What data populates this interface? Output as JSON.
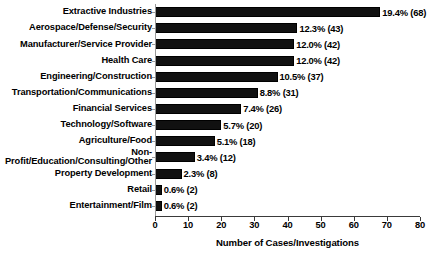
{
  "chart_data": {
    "type": "bar",
    "orientation": "horizontal",
    "title": "",
    "xlabel": "Number of Cases/Investigations",
    "ylabel": "",
    "xlim": [
      0,
      80
    ],
    "xticks": [
      0,
      10,
      20,
      30,
      40,
      50,
      60,
      70,
      80
    ],
    "grid": false,
    "legend": null,
    "categories": [
      "Extractive Industries",
      "Aerospace/Defense/Security",
      "Manufacturer/Service Provider",
      "Health Care",
      "Engineering/Construction",
      "Transportation/Communications",
      "Financial Services",
      "Technology/Software",
      "Agriculture/Food",
      "Non-\nProfit/Education/Consulting/Other",
      "Property Development",
      "Retail",
      "Entertainment/Film"
    ],
    "values": [
      68,
      43,
      42,
      42,
      37,
      31,
      26,
      20,
      18,
      12,
      8,
      2,
      2
    ],
    "percents": [
      "19.4%",
      "12.3%",
      "12.0%",
      "12.0%",
      "10.5%",
      "8.8%",
      "7.4%",
      "5.7%",
      "5.1%",
      "3.4%",
      "2.3%",
      "0.6%",
      "0.6%"
    ],
    "data_labels": [
      "19.4% (68)",
      "12.3% (43)",
      "12.0% (42)",
      "12.0% (42)",
      "10.5% (37)",
      "8.8% (31)",
      "7.4% (26)",
      "5.7% (20)",
      "5.1% (18)",
      "3.4% (12)",
      "2.3% (8)",
      "0.6% (2)",
      "0.6% (2)"
    ],
    "bar_color": "#111111"
  }
}
